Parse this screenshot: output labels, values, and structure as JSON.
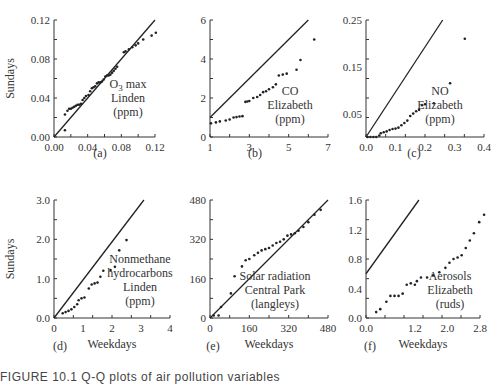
{
  "figure": {
    "caption_partial": "FIGURE 10.1  Q-Q plots of air pollution variables"
  },
  "chart_data": [
    {
      "type": "scatter",
      "panel": "(a)",
      "annotation": [
        "O3 max",
        "Linden",
        "(ppm)"
      ],
      "xlabel": "",
      "ylabel": "Sundays",
      "xlim": [
        0,
        0.12
      ],
      "ylim": [
        0,
        0.12
      ],
      "xticks": [
        "0.00",
        "0.04",
        "0.08",
        "0.12"
      ],
      "yticks": [
        "0.00",
        "0.04",
        "0.08",
        "0.12"
      ],
      "reference_line": [
        [
          0,
          0
        ],
        [
          0.12,
          0.12
        ]
      ],
      "points": [
        [
          0.013,
          0.007
        ],
        [
          0.013,
          0.023
        ],
        [
          0.016,
          0.027
        ],
        [
          0.018,
          0.029
        ],
        [
          0.02,
          0.029
        ],
        [
          0.022,
          0.03
        ],
        [
          0.024,
          0.031
        ],
        [
          0.026,
          0.032
        ],
        [
          0.028,
          0.033
        ],
        [
          0.03,
          0.033
        ],
        [
          0.032,
          0.034
        ],
        [
          0.034,
          0.038
        ],
        [
          0.036,
          0.04
        ],
        [
          0.038,
          0.042
        ],
        [
          0.041,
          0.043
        ],
        [
          0.043,
          0.047
        ],
        [
          0.045,
          0.05
        ],
        [
          0.047,
          0.051
        ],
        [
          0.049,
          0.052
        ],
        [
          0.051,
          0.055
        ],
        [
          0.053,
          0.056
        ],
        [
          0.055,
          0.056
        ],
        [
          0.057,
          0.057
        ],
        [
          0.059,
          0.059
        ],
        [
          0.061,
          0.062
        ],
        [
          0.063,
          0.063
        ],
        [
          0.065,
          0.063
        ],
        [
          0.067,
          0.064
        ],
        [
          0.069,
          0.066
        ],
        [
          0.071,
          0.068
        ],
        [
          0.073,
          0.07
        ],
        [
          0.075,
          0.072
        ],
        [
          0.083,
          0.087
        ],
        [
          0.085,
          0.088
        ],
        [
          0.089,
          0.09
        ],
        [
          0.093,
          0.092
        ],
        [
          0.097,
          0.094
        ],
        [
          0.1,
          0.096
        ],
        [
          0.106,
          0.1
        ],
        [
          0.116,
          0.104
        ],
        [
          0.121,
          0.107
        ]
      ]
    },
    {
      "type": "scatter",
      "panel": "(b)",
      "annotation": [
        "CO",
        "Elizabeth",
        "(ppm)"
      ],
      "xlabel": "",
      "ylabel": "",
      "xlim": [
        1,
        7
      ],
      "ylim": [
        0,
        6
      ],
      "xticks": [
        "1",
        "3",
        "5",
        "7"
      ],
      "yticks": [
        "0",
        "2",
        "4",
        "6"
      ],
      "reference_line": [
        [
          1,
          1
        ],
        [
          6,
          6
        ]
      ],
      "points": [
        [
          1.05,
          0.7
        ],
        [
          1.3,
          0.75
        ],
        [
          1.5,
          0.8
        ],
        [
          1.8,
          0.85
        ],
        [
          2.0,
          0.9
        ],
        [
          2.2,
          1.0
        ],
        [
          2.35,
          1.02
        ],
        [
          2.5,
          1.05
        ],
        [
          2.65,
          1.07
        ],
        [
          2.8,
          1.8
        ],
        [
          2.9,
          1.82
        ],
        [
          3.0,
          1.85
        ],
        [
          3.2,
          2.0
        ],
        [
          3.4,
          2.05
        ],
        [
          3.55,
          2.15
        ],
        [
          3.7,
          2.3
        ],
        [
          3.85,
          2.35
        ],
        [
          4.0,
          2.45
        ],
        [
          4.2,
          2.55
        ],
        [
          4.35,
          2.7
        ],
        [
          4.5,
          3.15
        ],
        [
          4.7,
          3.2
        ],
        [
          4.9,
          3.25
        ],
        [
          5.4,
          3.45
        ],
        [
          5.6,
          3.95
        ],
        [
          6.3,
          5.0
        ]
      ]
    },
    {
      "type": "scatter",
      "panel": "(c)",
      "annotation": [
        "NO",
        "Elizabeth",
        "(ppm)"
      ],
      "xlabel": "",
      "ylabel": "",
      "xlim": [
        0,
        0.4
      ],
      "ylim": [
        0,
        0.25
      ],
      "xticks": [
        "0.0",
        "0.1",
        "0.2",
        "0.3",
        "0.4"
      ],
      "yticks": [
        "0.05",
        "0.15",
        "0.25"
      ],
      "reference_line": [
        [
          0,
          0
        ],
        [
          0.26,
          0.25
        ]
      ],
      "points": [
        [
          0.005,
          0.0
        ],
        [
          0.015,
          0.0
        ],
        [
          0.025,
          0.0
        ],
        [
          0.035,
          0.0
        ],
        [
          0.045,
          0.003
        ],
        [
          0.05,
          0.008
        ],
        [
          0.06,
          0.01
        ],
        [
          0.07,
          0.012
        ],
        [
          0.08,
          0.015
        ],
        [
          0.09,
          0.017
        ],
        [
          0.1,
          0.018
        ],
        [
          0.11,
          0.02
        ],
        [
          0.12,
          0.025
        ],
        [
          0.13,
          0.03
        ],
        [
          0.14,
          0.035
        ],
        [
          0.15,
          0.045
        ],
        [
          0.16,
          0.05
        ],
        [
          0.17,
          0.055
        ],
        [
          0.18,
          0.058
        ],
        [
          0.19,
          0.068
        ],
        [
          0.2,
          0.07
        ],
        [
          0.23,
          0.072
        ],
        [
          0.285,
          0.115
        ],
        [
          0.335,
          0.21
        ]
      ]
    },
    {
      "type": "scatter",
      "panel": "(d)",
      "annotation": [
        "Nonmethane",
        "hydrocarbons",
        "Linden",
        "(ppm)"
      ],
      "xlabel": "Weekdays",
      "ylabel": "Sundays",
      "xlim": [
        0,
        4
      ],
      "ylim": [
        0,
        3.0
      ],
      "xticks": [
        "0",
        "1",
        "2",
        "3",
        "4"
      ],
      "yticks": [
        "0.0",
        "1.0",
        "2.0",
        "3.0"
      ],
      "reference_line": [
        [
          0,
          0
        ],
        [
          3.1,
          3.0
        ]
      ],
      "points": [
        [
          0.3,
          0.12
        ],
        [
          0.4,
          0.15
        ],
        [
          0.5,
          0.18
        ],
        [
          0.6,
          0.22
        ],
        [
          0.7,
          0.28
        ],
        [
          0.8,
          0.35
        ],
        [
          0.85,
          0.45
        ],
        [
          0.95,
          0.5
        ],
        [
          1.05,
          0.52
        ],
        [
          1.2,
          0.75
        ],
        [
          1.3,
          0.85
        ],
        [
          1.4,
          0.88
        ],
        [
          1.5,
          0.9
        ],
        [
          1.6,
          1.05
        ],
        [
          1.7,
          1.2
        ],
        [
          1.95,
          1.22
        ],
        [
          2.1,
          1.3
        ],
        [
          2.25,
          1.72
        ],
        [
          2.5,
          1.98
        ]
      ]
    },
    {
      "type": "scatter",
      "panel": "(e)",
      "annotation": [
        "Solar radiation",
        "Central Park",
        "(langleys)"
      ],
      "xlabel": "Weekdays",
      "ylabel": "",
      "xlim": [
        0,
        480
      ],
      "ylim": [
        0,
        480
      ],
      "xticks": [
        "0",
        "160",
        "320",
        "480"
      ],
      "yticks": [
        "0",
        "160",
        "320",
        "480"
      ],
      "reference_line": [
        [
          0,
          0
        ],
        [
          480,
          480
        ]
      ],
      "points": [
        [
          15,
          10
        ],
        [
          35,
          10
        ],
        [
          45,
          45
        ],
        [
          85,
          100
        ],
        [
          100,
          170
        ],
        [
          130,
          210
        ],
        [
          145,
          235
        ],
        [
          160,
          240
        ],
        [
          180,
          255
        ],
        [
          195,
          265
        ],
        [
          210,
          275
        ],
        [
          225,
          280
        ],
        [
          240,
          285
        ],
        [
          255,
          295
        ],
        [
          270,
          305
        ],
        [
          285,
          310
        ],
        [
          300,
          320
        ],
        [
          315,
          335
        ],
        [
          330,
          340
        ],
        [
          345,
          345
        ],
        [
          360,
          355
        ],
        [
          380,
          370
        ],
        [
          400,
          390
        ],
        [
          425,
          420
        ],
        [
          450,
          440
        ]
      ]
    },
    {
      "type": "scatter",
      "panel": "(f)",
      "annotation": [
        "Aerosols",
        "Elizabeth",
        "(ruds)"
      ],
      "xlabel": "Weekdays",
      "ylabel": "",
      "xlim": [
        0,
        2.8
      ],
      "ylim": [
        0,
        1.6
      ],
      "xticks": [
        "0.0",
        "1.2",
        "2.0",
        "2.8"
      ],
      "yticks": [
        "0.0",
        "0.4",
        "0.8",
        "1.2",
        "1.6"
      ],
      "reference_line": [
        [
          0,
          0.6
        ],
        [
          1.3,
          1.6
        ]
      ],
      "points": [
        [
          0.25,
          0.08
        ],
        [
          0.35,
          0.12
        ],
        [
          0.5,
          0.22
        ],
        [
          0.6,
          0.3
        ],
        [
          0.7,
          0.3
        ],
        [
          0.8,
          0.3
        ],
        [
          0.9,
          0.33
        ],
        [
          1.0,
          0.45
        ],
        [
          1.1,
          0.47
        ],
        [
          1.2,
          0.45
        ],
        [
          1.25,
          0.5
        ],
        [
          1.35,
          0.55
        ],
        [
          1.5,
          0.55
        ],
        [
          1.65,
          0.58
        ],
        [
          1.8,
          0.62
        ],
        [
          1.95,
          0.68
        ],
        [
          2.05,
          0.75
        ],
        [
          2.15,
          0.8
        ],
        [
          2.25,
          0.82
        ],
        [
          2.35,
          0.85
        ],
        [
          2.45,
          0.95
        ],
        [
          2.55,
          1.05
        ],
        [
          2.65,
          1.15
        ],
        [
          2.78,
          1.3
        ],
        [
          2.9,
          1.4
        ]
      ]
    }
  ]
}
